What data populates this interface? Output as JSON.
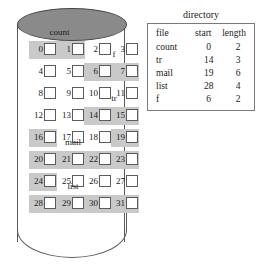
{
  "figure": {
    "disk": {
      "name": "disk-cylinder",
      "total_blocks": 32,
      "blocks_per_row": 4,
      "rows": [
        {
          "label": "count",
          "label_span": [
            0,
            1
          ],
          "blocks": [
            0,
            1,
            2,
            3
          ],
          "shaded": [
            0,
            1
          ]
        },
        {
          "label": "f",
          "label_span": [
            6,
            7
          ],
          "blocks": [
            4,
            5,
            6,
            7
          ],
          "shaded": [
            6,
            7
          ]
        },
        {
          "label": "",
          "label_span": null,
          "blocks": [
            8,
            9,
            10,
            11
          ],
          "shaded": []
        },
        {
          "label": "tr",
          "label_span": [
            14,
            15
          ],
          "blocks": [
            12,
            13,
            14,
            15
          ],
          "shaded": [
            14,
            15
          ]
        },
        {
          "label": "",
          "label_span": null,
          "blocks": [
            16,
            17,
            18,
            19
          ],
          "shaded": [
            16,
            19
          ]
        },
        {
          "label": "mail",
          "label_span": [
            20,
            22
          ],
          "blocks": [
            20,
            21,
            22,
            23
          ],
          "shaded": [
            20,
            21,
            22,
            23
          ]
        },
        {
          "label": "",
          "label_span": null,
          "blocks": [
            24,
            25,
            26,
            27
          ],
          "shaded": [
            24
          ]
        },
        {
          "label": "list",
          "label_span": [
            28,
            30
          ],
          "blocks": [
            28,
            29,
            30,
            31
          ],
          "shaded": [
            28,
            29,
            30,
            31
          ]
        }
      ],
      "block_numbers": [
        "0",
        "1",
        "2",
        "3",
        "4",
        "5",
        "6",
        "7",
        "8",
        "9",
        "10",
        "11",
        "12",
        "13",
        "14",
        "15",
        "16",
        "17",
        "18",
        "19",
        "20",
        "21",
        "22",
        "23",
        "24",
        "25",
        "26",
        "27",
        "28",
        "29",
        "30",
        "31"
      ],
      "shaded_color": "#c9c9c9",
      "platter_color": "#8a8a8a"
    }
  },
  "directory": {
    "caption": "directory",
    "columns": [
      "file",
      "start",
      "length"
    ],
    "rows": [
      {
        "file": "count",
        "start": "0",
        "length": "2"
      },
      {
        "file": "tr",
        "start": "14",
        "length": "3"
      },
      {
        "file": "mail",
        "start": "19",
        "length": "6"
      },
      {
        "file": "list",
        "start": "28",
        "length": "4"
      },
      {
        "file": "f",
        "start": "6",
        "length": "2"
      }
    ]
  }
}
